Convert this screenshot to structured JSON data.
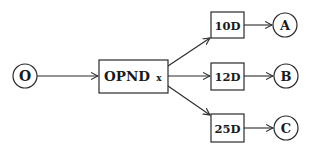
{
  "diagram": {
    "type": "flow",
    "nodes": {
      "start": {
        "label": "O",
        "shape": "circle"
      },
      "opnd": {
        "label": "OPND",
        "sub": "x",
        "shape": "box"
      },
      "d10": {
        "label": "10D",
        "shape": "box"
      },
      "d12": {
        "label": "12D",
        "shape": "box"
      },
      "d25": {
        "label": "25D",
        "shape": "box"
      },
      "outA": {
        "label": "A",
        "shape": "circle"
      },
      "outB": {
        "label": "B",
        "shape": "circle"
      },
      "outC": {
        "label": "C",
        "shape": "circle"
      }
    },
    "edges": [
      {
        "from": "O",
        "to": "OPND x"
      },
      {
        "from": "OPND x",
        "to": "10D"
      },
      {
        "from": "OPND x",
        "to": "12D"
      },
      {
        "from": "OPND x",
        "to": "25D"
      },
      {
        "from": "10D",
        "to": "A"
      },
      {
        "from": "12D",
        "to": "B"
      },
      {
        "from": "25D",
        "to": "C"
      }
    ],
    "colors": {
      "stroke": "#2a2a2a",
      "background": "#ffffff"
    }
  }
}
